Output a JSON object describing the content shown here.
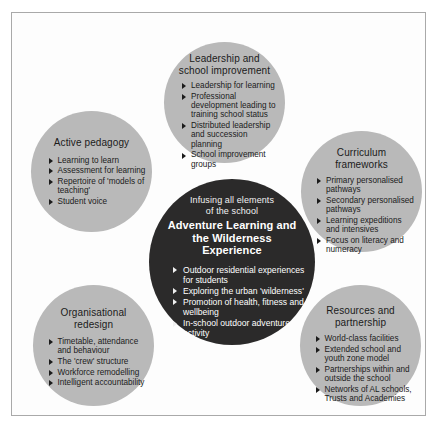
{
  "diagram": {
    "title": "Adventure Learning and the Wilderness Experience",
    "colors": {
      "satellite_fill": "#b9b9b9",
      "hub_fill": "#2b2a2a",
      "hub_text": "#ffffff",
      "satellite_text": "#1b1b1b",
      "frame_border": "#a9a9a9",
      "background": "#ffffff"
    },
    "hub": {
      "kicker": "Infusing all elements\nof the school",
      "headline": "Adventure Learning and\nthe Wilderness Experience",
      "bullets": [
        "Outdoor residential experiences for students",
        "Exploring the urban 'wilderness'",
        "Promotion of health, fitness and wellbeing",
        "In-school outdoor adventure activity"
      ]
    },
    "satellites": [
      {
        "id": "leadership",
        "title": "Leadership and\nschool improvement",
        "bullets": [
          "Leadership for learning",
          "Professional development leading to training school status",
          "Distributed leadership and succession planning",
          "School improvement groups"
        ]
      },
      {
        "id": "pedagogy",
        "title": "Active pedagogy",
        "bullets": [
          "Learning to learn",
          "Assessment for learning",
          "Repertoire of 'models of teaching'",
          "Student voice"
        ]
      },
      {
        "id": "curriculum",
        "title": "Curriculum\nframeworks",
        "bullets": [
          "Primary personalised pathways",
          "Secondary personalised pathways",
          "Learning expeditions and intensives",
          "Focus on literacy and numeracy"
        ]
      },
      {
        "id": "organisational",
        "title": "Organisational\nredesign",
        "bullets": [
          "Timetable, attendance and behaviour",
          "The 'crew' structure",
          "Workforce remodelling",
          "Intelligent accountability"
        ]
      },
      {
        "id": "resources",
        "title": "Resources and\npartnership",
        "bullets": [
          "World-class facilities",
          "Extended school and youth zone model",
          "Partnerships within and outside the school",
          "Networks of AL schools, Trusts and Academies"
        ]
      }
    ]
  }
}
